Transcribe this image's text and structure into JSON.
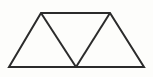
{
  "figure": {
    "kind": "geometric-line-drawing",
    "canvas": {
      "width": 153,
      "height": 77,
      "background_color": "#fdfdfb",
      "page_background_color": "#ffffff"
    },
    "style": {
      "stroke_color": "#2b2b2b",
      "stroke_width": 2,
      "fill_color": "none",
      "line_cap": "butt",
      "line_join": "miter"
    },
    "vertices": {
      "bottom_left": {
        "label": "A",
        "x": 9,
        "y": 67
      },
      "bottom_middle": {
        "label": "B",
        "x": 76,
        "y": 67
      },
      "bottom_right": {
        "label": "C",
        "x": 144,
        "y": 67
      },
      "top_left": {
        "label": "D",
        "x": 41,
        "y": 13
      },
      "top_right": {
        "label": "E",
        "x": 110,
        "y": 13
      }
    },
    "outline": {
      "name": "isosceles-trapezoid",
      "points": "9,67 41,13 110,13 144,67",
      "closed": true,
      "top_width": 69,
      "bottom_width": 135,
      "height": 54
    },
    "edges": [
      {
        "name": "bottom-base",
        "from": "bottom_left",
        "to": "bottom_right",
        "x1": 9,
        "y1": 67,
        "x2": 144,
        "y2": 67,
        "role": "outline"
      },
      {
        "name": "top-base",
        "from": "top_left",
        "to": "top_right",
        "x1": 41,
        "y1": 13,
        "x2": 110,
        "y2": 13,
        "role": "outline"
      },
      {
        "name": "left-leg",
        "from": "bottom_left",
        "to": "top_left",
        "x1": 9,
        "y1": 67,
        "x2": 41,
        "y2": 13,
        "role": "outline"
      },
      {
        "name": "right-leg",
        "from": "top_right",
        "to": "bottom_right",
        "x1": 110,
        "y1": 13,
        "x2": 144,
        "y2": 67,
        "role": "outline"
      },
      {
        "name": "left-diagonal",
        "from": "top_left",
        "to": "bottom_middle",
        "x1": 41,
        "y1": 13,
        "x2": 76,
        "y2": 67,
        "role": "interior-divider"
      },
      {
        "name": "right-diagonal",
        "from": "bottom_middle",
        "to": "top_right",
        "x1": 76,
        "y1": 67,
        "x2": 110,
        "y2": 13,
        "role": "interior-divider"
      }
    ],
    "triangles": [
      {
        "name": "left-triangle",
        "orientation": "upward",
        "points": "9,67 41,13 76,67"
      },
      {
        "name": "middle-triangle",
        "orientation": "downward",
        "points": "41,13 110,13 76,67"
      },
      {
        "name": "right-triangle",
        "orientation": "upward",
        "points": "76,67 110,13 144,67"
      }
    ],
    "counts": {
      "triangles": 3,
      "upward_triangles": 2,
      "downward_triangles": 1,
      "vertices": 5,
      "line_segments": 6
    }
  }
}
